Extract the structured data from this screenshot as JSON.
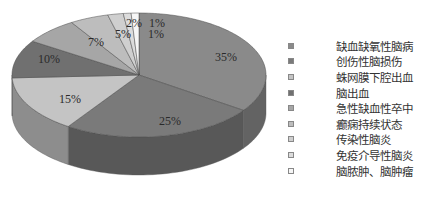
{
  "chart_data": {
    "type": "pie",
    "style": "3d",
    "title": "",
    "categories": [
      "缺血缺氧性脑病",
      "创伤性脑损伤",
      "蛛网膜下腔出血",
      "脑出血",
      "急性缺血性卒中",
      "癫痫持续状态",
      "传染性脑炎",
      "免疫介导性脑炎",
      "脑脓肿、脑肿瘤"
    ],
    "values": [
      35,
      25,
      15,
      10,
      7,
      5,
      2,
      1,
      1
    ],
    "labels": [
      "35%",
      "25%",
      "15%",
      "10%",
      "7%",
      "5%",
      "2%",
      "1%",
      "1%"
    ],
    "colors": [
      "#8a8a8a",
      "#7a7a7a",
      "#c4c4c4",
      "#707070",
      "#a6a6a6",
      "#bdbdbd",
      "#cfcfcf",
      "#dcdcdc",
      "#f6f6f6"
    ],
    "legend_position": "right"
  },
  "legend": {
    "items": [
      {
        "label": "缺血缺氧性脑病",
        "color": "#8a8a8a"
      },
      {
        "label": "创伤性脑损伤",
        "color": "#7a7a7a"
      },
      {
        "label": "蛛网膜下腔出血",
        "color": "#c4c4c4"
      },
      {
        "label": "脑出血",
        "color": "#707070"
      },
      {
        "label": "急性缺血性卒中",
        "color": "#a6a6a6"
      },
      {
        "label": "癫痫持续状态",
        "color": "#bdbdbd"
      },
      {
        "label": "传染性脑炎",
        "color": "#cfcfcf"
      },
      {
        "label": "免疫介导性脑炎",
        "color": "#dcdcdc"
      },
      {
        "label": "脑脓肿、脑肿瘤",
        "color": "#f6f6f6"
      }
    ]
  }
}
